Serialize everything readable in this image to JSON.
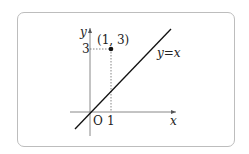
{
  "diagram": {
    "axes": {
      "x_label": "x",
      "y_label": "y",
      "origin_label": "O"
    },
    "ticks": {
      "x": "1",
      "y": "3"
    },
    "point": {
      "label": "(1, 3)",
      "x": 1,
      "y": 3
    },
    "line": {
      "label": "y=x",
      "equation": "y = x"
    }
  }
}
